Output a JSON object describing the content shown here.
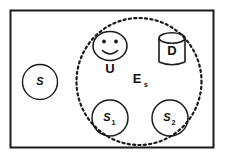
{
  "diagram": {
    "colors": {
      "stroke": "#1a1a1a",
      "text": "#111111",
      "background": "#ffffff"
    },
    "outer_boundary": {
      "name": "outer-rectangle",
      "shape": "rectangle",
      "label": ""
    },
    "environment": {
      "name": "environment-region",
      "shape": "dashed-circle",
      "label": "E",
      "subscript": "s"
    },
    "nodes": [
      {
        "id": "s-outside",
        "shape": "circle",
        "label": "S",
        "subscript": "",
        "inside_environment": false
      },
      {
        "id": "s1",
        "shape": "circle",
        "label": "S",
        "subscript": "1",
        "inside_environment": true
      },
      {
        "id": "s2",
        "shape": "circle",
        "label": "S",
        "subscript": "2",
        "inside_environment": true
      }
    ],
    "user": {
      "id": "user-actor",
      "icon": "smiley-face-icon",
      "label": "U"
    },
    "database": {
      "id": "database-store",
      "icon": "database-cylinder-icon",
      "label": "D"
    }
  }
}
